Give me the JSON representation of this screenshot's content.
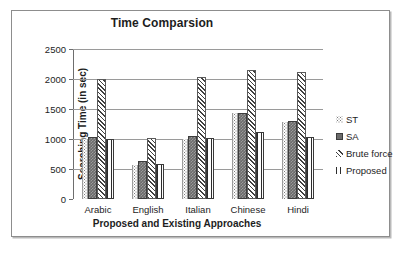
{
  "chart_data": {
    "type": "bar",
    "title": "Time Comparsion",
    "xlabel": "Proposed and Existing Approaches",
    "ylabel": "Searching Time (in sec)",
    "categories": [
      "Arabic",
      "English",
      "Italian",
      "Chinese",
      "Hindi"
    ],
    "series": [
      {
        "name": "ST",
        "values": [
          1000,
          570,
          1000,
          1430,
          1290
        ]
      },
      {
        "name": "SA",
        "values": [
          1030,
          630,
          1050,
          1440,
          1300
        ]
      },
      {
        "name": "Brute force",
        "values": [
          2000,
          1010,
          2030,
          2150,
          2120
        ]
      },
      {
        "name": "Proposed",
        "values": [
          1000,
          580,
          1020,
          1110,
          1040
        ]
      }
    ],
    "ylim": [
      0,
      2500
    ],
    "yticks": [
      0,
      500,
      1000,
      1500,
      2000,
      2500
    ],
    "ytick_labels": [
      "0",
      "500",
      "1000",
      "1500",
      "2000",
      "2500"
    ],
    "grid": true,
    "legend_position": "right",
    "patterns": {
      "ST": "dotted",
      "SA": "solid-dark-gray",
      "Brute force": "diagonal-hatch",
      "Proposed": "vertical-lines"
    },
    "colors": {
      "ST": "#7a7a7a",
      "SA": "#6b6b6b",
      "Brute force": "#3f3f3f",
      "Proposed": "#2d2d2d",
      "gridline": "#9a9a9a",
      "axis": "#6e6e6e",
      "text": "#1d1d1d",
      "frame": "#8d8d8d"
    }
  }
}
